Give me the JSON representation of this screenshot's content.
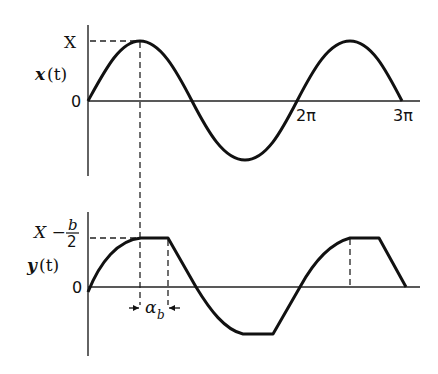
{
  "diagram": {
    "top_plot": {
      "y_label": "x(t)",
      "y_label_var": "x",
      "y_label_arg": "(t)",
      "peak_label": "X",
      "zero_label": "0",
      "tick_labels": [
        "2π",
        "3π"
      ],
      "description": "Sine wave x(t) = X sin(ωt) over 0 to 3π"
    },
    "bottom_plot": {
      "y_label": "y(t)",
      "y_label_var": "y",
      "y_label_arg": "(t)",
      "level_label_top": "X −",
      "level_label_frac_num": "b",
      "level_label_frac_den": "2",
      "zero_label": "0",
      "interval_label": "α",
      "interval_subscript": "b",
      "description": "Clipped sine wave y(t) saturating at ±(X − b/2), delayed plateaus of width α_b"
    },
    "colors": {
      "ink": "#111111",
      "background": "#ffffff"
    }
  }
}
